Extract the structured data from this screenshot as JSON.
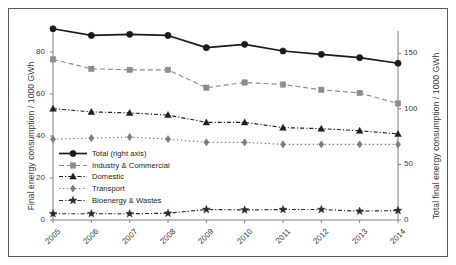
{
  "chart_data": {
    "type": "line",
    "title": "",
    "xlabel": "",
    "ylabel": "Final energy consumption / 1000 GWh",
    "ylabel_right": "Total final energy consumption / 1000 GWh",
    "categories": [
      "2005",
      "2006",
      "2007",
      "2008",
      "2009",
      "2010",
      "2011",
      "2012",
      "2013",
      "2014"
    ],
    "ylim": [
      0,
      90
    ],
    "yticks": [
      0,
      20,
      40,
      60,
      80
    ],
    "ylim_right": [
      0,
      170
    ],
    "yticks_right": [
      0,
      50,
      100,
      150
    ],
    "grid": false,
    "legend_position": "center-left",
    "series": [
      {
        "name": "Total (right axis)",
        "axis": "right",
        "marker": "circle",
        "linestyle": "solid",
        "color": "#1a1a1a",
        "values": [
          172,
          166,
          167,
          166,
          155,
          158,
          152,
          149,
          146,
          141
        ],
        "left_scale_equivalent": [
          86,
          83,
          83.5,
          83,
          77.5,
          79,
          76,
          74.5,
          73,
          70.5
        ]
      },
      {
        "name": "Industry & Commercial",
        "axis": "left",
        "marker": "square",
        "linestyle": "dashed",
        "color": "#8c8c8c",
        "values": [
          76.5,
          72,
          71.5,
          71.5,
          63,
          65.5,
          64.5,
          62,
          60.5,
          55.5
        ]
      },
      {
        "name": "Domestic",
        "axis": "left",
        "marker": "triangle",
        "linestyle": "dash-dot",
        "color": "#1f1f1f",
        "values": [
          53,
          51.5,
          51,
          50,
          46.5,
          46.5,
          44,
          43.5,
          42.5,
          41
        ]
      },
      {
        "name": "Transport",
        "axis": "left",
        "marker": "diamond",
        "linestyle": "dotted",
        "color": "#7d7d7d",
        "values": [
          38.5,
          39,
          39.5,
          38.5,
          37,
          37,
          36,
          36,
          36,
          36
        ]
      },
      {
        "name": "Bioenergy & Wastes",
        "axis": "left",
        "marker": "star",
        "linestyle": "dash-dot",
        "color": "#2b2b2b",
        "values": [
          3,
          3,
          3,
          3.2,
          5,
          4.8,
          5,
          5,
          4.2,
          4.5
        ]
      }
    ]
  },
  "legend": {
    "items": [
      {
        "label": "Total (right axis)"
      },
      {
        "label": "Industry & Commercial"
      },
      {
        "label": "Domestic"
      },
      {
        "label": "Transport"
      },
      {
        "label": "Bioenergy & Wastes"
      }
    ]
  }
}
